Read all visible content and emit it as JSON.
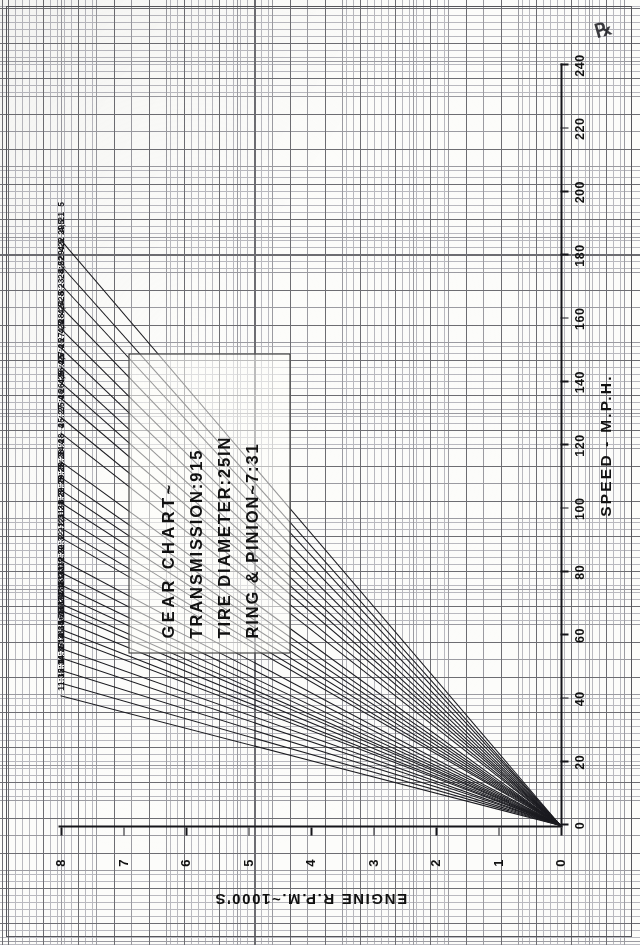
{
  "chart_data": {
    "type": "line",
    "title": "GEAR CHART~",
    "subtitle_lines": [
      "TRANSMISSION:915",
      "TIRE DIAMETER:25IN",
      "RING & PINION~7:31"
    ],
    "xlabel": "SPEED - M.P.H.",
    "ylabel": "ENGINE R.P.M.~1000'S",
    "xlim": [
      0,
      240
    ],
    "ylim": [
      0,
      8
    ],
    "xticks": [
      0,
      20,
      40,
      60,
      80,
      100,
      120,
      140,
      160,
      180,
      200,
      220,
      240
    ],
    "xticklabels": [
      "0",
      "20",
      "40",
      "60",
      "80",
      "100",
      "120",
      "140",
      "160",
      "180",
      "200",
      "220",
      "240"
    ],
    "yticks": [
      0,
      1,
      2,
      3,
      4,
      5,
      6,
      7,
      8
    ],
    "yticklabels": [
      "0",
      "1",
      "2",
      "3",
      "4",
      "5",
      "6",
      "7",
      "8"
    ],
    "grid": true,
    "grid_style": "engineering graph paper, 20 divisions per major",
    "legend": "none - lines labelled in place at left ends",
    "orientation": "chart drawn in landscape, page scanned portrait (rotated 90 degrees)",
    "series": [
      {
        "name": "29:21",
        "gears": "5",
        "mph_at_8000rpm": 185
      },
      {
        "name": "29:22",
        "gears": "4,5",
        "mph_at_8000rpm": 177
      },
      {
        "name": "28:22",
        "gears": "4,5",
        "mph_at_8000rpm": 171
      },
      {
        "name": "28:23",
        "gears": "4,5",
        "mph_at_8000rpm": 164
      },
      {
        "name": "28:24",
        "gears": "5",
        "mph_at_8000rpm": 157
      },
      {
        "name": "27:24",
        "gears": "4,5",
        "mph_at_8000rpm": 151
      },
      {
        "name": "27:25",
        "gears": "4,5",
        "mph_at_8000rpm": 145
      },
      {
        "name": "26:25",
        "gears": "4",
        "mph_at_8000rpm": 140
      },
      {
        "name": "26:26",
        "gears": "4,5",
        "mph_at_8000rpm": 135
      },
      {
        "name": "25:26",
        "gears": "4,5",
        "mph_at_8000rpm": 129
      },
      {
        "name": "25:27",
        "gears": "4",
        "mph_at_8000rpm": 124
      },
      {
        "name": "24:28",
        "gears": "4",
        "mph_at_8000rpm": 115
      },
      {
        "name": "23:28",
        "gears": "4",
        "mph_at_8000rpm": 110
      },
      {
        "name": "23:29",
        "gears": "3",
        "mph_at_8000rpm": 106
      },
      {
        "name": "22:29",
        "gears": "3",
        "mph_at_8000rpm": 102
      },
      {
        "name": "21:29",
        "gears": "3",
        "mph_at_8000rpm": 98
      },
      {
        "name": "21:30",
        "gears": "3",
        "mph_at_8000rpm": 94
      },
      {
        "name": "21:31",
        "gears": "3",
        "mph_at_8000rpm": 91
      },
      {
        "name": "20:32",
        "gears": "2,3",
        "mph_at_8000rpm": 84
      },
      {
        "name": "19:32",
        "gears": "2",
        "mph_at_8000rpm": 80
      },
      {
        "name": "18:32",
        "gears": "2",
        "mph_at_8000rpm": 76
      },
      {
        "name": "18:33",
        "gears": "2",
        "mph_at_8000rpm": 73
      },
      {
        "name": "17:33",
        "gears": "2",
        "mph_at_8000rpm": 70
      },
      {
        "name": "17:34",
        "gears": "2",
        "mph_at_8000rpm": 68
      },
      {
        "name": "16:34",
        "gears": "2",
        "mph_at_8000rpm": 65
      },
      {
        "name": "16:35",
        "gears": "2",
        "mph_at_8000rpm": 62
      },
      {
        "name": "15:35",
        "gears": "2",
        "mph_at_8000rpm": 60
      },
      {
        "name": "14:34",
        "gears": "1",
        "mph_at_8000rpm": 56
      },
      {
        "name": "15:36",
        "gears": "1",
        "mph_at_8000rpm": 53
      },
      {
        "name": "14:37",
        "gears": "1",
        "mph_at_8000rpm": 49
      },
      {
        "name": "12:34",
        "gears": "1",
        "mph_at_8000rpm": 45
      },
      {
        "name": "11:35",
        "gears": "1",
        "mph_at_8000rpm": 41
      }
    ]
  },
  "corner_mark": "℞"
}
